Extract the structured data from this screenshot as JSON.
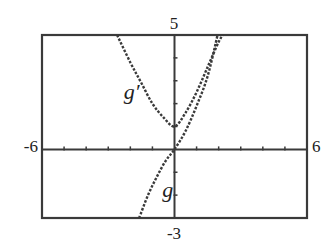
{
  "chart_data": {
    "type": "line",
    "title": "",
    "xlabel": "",
    "ylabel": "",
    "xlim": [
      -6,
      6
    ],
    "ylim": [
      -3,
      5
    ],
    "grid": false,
    "axes": {
      "x_ticks_every": 1,
      "y_ticks_every": 1,
      "window_labels": {
        "xmin": "-6",
        "xmax": "6",
        "ymin": "-3",
        "ymax": "5"
      }
    },
    "series": [
      {
        "name": "g'",
        "label": "g′",
        "style": "dotted",
        "points": [
          [
            -2.6,
            5
          ],
          [
            -2.0,
            3.8
          ],
          [
            -1.5,
            2.9
          ],
          [
            -1.0,
            2.0
          ],
          [
            -0.5,
            1.4
          ],
          [
            0,
            1
          ],
          [
            0.5,
            1.6
          ],
          [
            1.0,
            2.5
          ],
          [
            1.5,
            3.6
          ],
          [
            2.0,
            4.7
          ],
          [
            2.2,
            5
          ]
        ]
      },
      {
        "name": "g",
        "label": "g",
        "style": "dotted",
        "points": [
          [
            -1.6,
            -3
          ],
          [
            -1.2,
            -2.0
          ],
          [
            -0.8,
            -1.2
          ],
          [
            -0.4,
            -0.5
          ],
          [
            0,
            0
          ],
          [
            0.5,
            0.8
          ],
          [
            1.0,
            1.9
          ],
          [
            1.5,
            3.2
          ],
          [
            1.95,
            5
          ]
        ]
      }
    ],
    "annotations": [
      {
        "text": "g′",
        "x": -2.3,
        "y": 2.2
      },
      {
        "text": "g",
        "x": -0.55,
        "y": -2.1
      }
    ],
    "legend": "none"
  }
}
